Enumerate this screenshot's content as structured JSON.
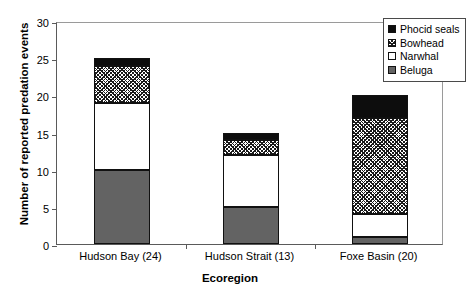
{
  "chart_data": {
    "type": "bar",
    "stacked": true,
    "title": "",
    "xlabel": "Ecoregion",
    "ylabel": "Number of reported predation events",
    "categories": [
      "Hudson Bay (24)",
      "Hudson Strait (13)",
      "Foxe Basin (20)"
    ],
    "series": [
      {
        "name": "Beluga",
        "values": [
          10,
          5,
          1
        ],
        "fill": "solid-gray",
        "color": "#636363"
      },
      {
        "name": "Narwhal",
        "values": [
          9,
          7,
          3
        ],
        "fill": "white",
        "color": "#ffffff"
      },
      {
        "name": "Bowhead",
        "values": [
          5,
          2,
          13
        ],
        "fill": "crosshatch",
        "color": "#1a1a1a"
      },
      {
        "name": "Phocid seals",
        "values": [
          1,
          1,
          3
        ],
        "fill": "solid-black",
        "color": "#0d0d0d"
      }
    ],
    "totals": [
      25,
      15,
      20
    ],
    "ylim": [
      0,
      30
    ],
    "yticks": [
      0,
      5,
      10,
      15,
      20,
      25,
      30
    ],
    "ytick_labels": [
      "0",
      "5",
      "10",
      "15",
      "20",
      "25",
      "30"
    ],
    "grid": false,
    "legend_position": "top-right",
    "legend_order": [
      "Phocid seals",
      "Bowhead",
      "Narwhal",
      "Beluga"
    ]
  },
  "legend": {
    "entries": [
      {
        "label": "Phocid seals",
        "swatch": "solid-black-swatch"
      },
      {
        "label": "Bowhead",
        "swatch": "crosshatch-swatch"
      },
      {
        "label": "Narwhal",
        "swatch": "white-swatch"
      },
      {
        "label": "Beluga",
        "swatch": "solid-gray-swatch"
      }
    ]
  }
}
